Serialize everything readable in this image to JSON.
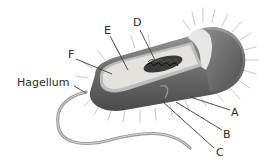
{
  "diagram": {
    "labels": [
      {
        "id": "A",
        "text": "A"
      },
      {
        "id": "B",
        "text": "B"
      },
      {
        "id": "C",
        "text": "C"
      },
      {
        "id": "D",
        "text": "D"
      },
      {
        "id": "E",
        "text": "E"
      },
      {
        "id": "F",
        "text": "F"
      },
      {
        "id": "flagellum",
        "text": "Hagellum"
      }
    ]
  },
  "colors": {
    "background": "#ffffff",
    "label_text": "#2a2a2a",
    "leader_line": "#3a3a3a",
    "outer_body": "#6e6e6e",
    "inner_cytoplasm": "#e4e2dc",
    "nucleoid": "#2a2a2a",
    "pili": "#cfcfcf"
  }
}
